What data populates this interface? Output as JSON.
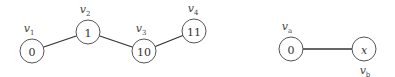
{
  "graphs": [
    {
      "nodes": [
        {
          "id": "v1",
          "label": "v",
          "sub": "1",
          "value": "0"
        },
        {
          "id": "v2",
          "label": "v",
          "sub": "2",
          "value": "1"
        },
        {
          "id": "v3",
          "label": "v",
          "sub": "3",
          "value": "10"
        },
        {
          "id": "v4",
          "label": "v",
          "sub": "4",
          "value": "11"
        }
      ],
      "edges": [
        [
          "v1",
          "v2"
        ],
        [
          "v2",
          "v3"
        ],
        [
          "v3",
          "v4"
        ]
      ]
    },
    {
      "nodes": [
        {
          "id": "va",
          "label": "v",
          "sub": "a",
          "value": "0"
        },
        {
          "id": "vb",
          "label": "v",
          "sub": "b",
          "value": "x"
        }
      ],
      "edges": [
        [
          "va",
          "vb"
        ]
      ]
    }
  ]
}
